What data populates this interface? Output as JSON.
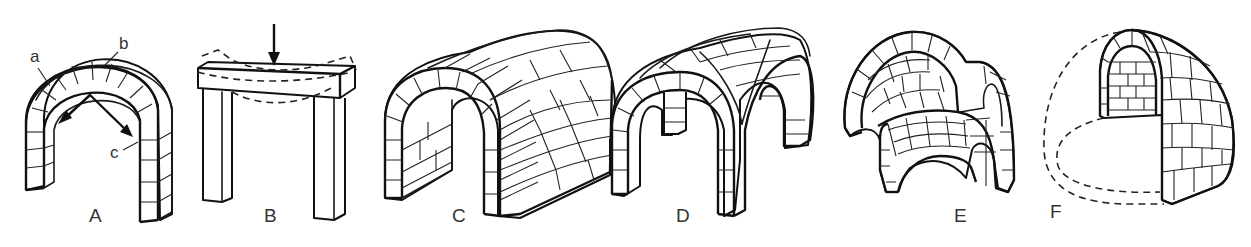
{
  "figure": {
    "panels": [
      {
        "id": "A",
        "label": "A",
        "subject": "masonry arch with thrust arrows",
        "callouts": [
          "a",
          "b",
          "c"
        ]
      },
      {
        "id": "B",
        "label": "B",
        "subject": "post and lintel with load arrow and deflection (dashed)"
      },
      {
        "id": "C",
        "label": "C",
        "subject": "barrel vault"
      },
      {
        "id": "D",
        "label": "D",
        "subject": "groin vault"
      },
      {
        "id": "E",
        "label": "E",
        "subject": "dome on pendentives fragment"
      },
      {
        "id": "F",
        "label": "F",
        "subject": "dome (cutaway, dashed outline)"
      }
    ]
  },
  "colors": {
    "line": "#1a1a1a",
    "label": "#333333",
    "background": "#ffffff"
  }
}
